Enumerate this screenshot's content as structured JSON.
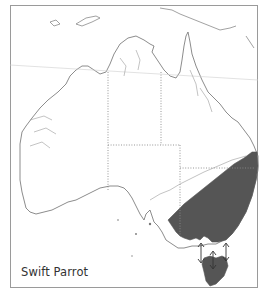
{
  "map": {
    "title": "Swift Parrot",
    "region": "Australia",
    "legend": {
      "shaded_label": "Distribution range",
      "shaded_color": "#555555",
      "migration_arrows": 3
    },
    "colors": {
      "frame": "#9a9a9a",
      "coastline": "#6e6e6e",
      "border_dotted": "#8a8a8a",
      "range_fill": "#555555",
      "background": "#ffffff"
    }
  }
}
